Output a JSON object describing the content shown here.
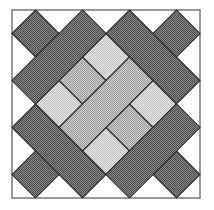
{
  "colors": {
    "background": "#ffffff",
    "border": "#777777",
    "outline": "#333333",
    "dark": "#6e6e6e",
    "medium": "#b4b4b4",
    "light": "#d6d6d6"
  },
  "frame": {
    "x": 12,
    "y": 10,
    "size": 188,
    "units": 8
  },
  "pieces": [
    {
      "name": "corner-square-top-left",
      "tone": "dark",
      "points": [
        [
          1,
          0
        ],
        [
          2,
          1
        ],
        [
          1,
          2
        ],
        [
          0,
          1
        ]
      ]
    },
    {
      "name": "corner-square-top-right",
      "tone": "dark",
      "points": [
        [
          7,
          0
        ],
        [
          8,
          1
        ],
        [
          7,
          2
        ],
        [
          6,
          1
        ]
      ]
    },
    {
      "name": "corner-square-bottom-left",
      "tone": "dark",
      "points": [
        [
          1,
          6
        ],
        [
          2,
          7
        ],
        [
          1,
          8
        ],
        [
          0,
          7
        ]
      ]
    },
    {
      "name": "corner-square-bottom-right",
      "tone": "dark",
      "points": [
        [
          7,
          6
        ],
        [
          8,
          7
        ],
        [
          7,
          8
        ],
        [
          6,
          7
        ]
      ]
    },
    {
      "name": "center-square-top",
      "tone": "light",
      "points": [
        [
          4,
          1
        ],
        [
          5,
          2
        ],
        [
          4,
          3
        ],
        [
          3,
          2
        ]
      ]
    },
    {
      "name": "center-square-left",
      "tone": "light",
      "points": [
        [
          2,
          3
        ],
        [
          3,
          4
        ],
        [
          2,
          5
        ],
        [
          1,
          4
        ]
      ]
    },
    {
      "name": "center-square-right",
      "tone": "light",
      "points": [
        [
          6,
          3
        ],
        [
          7,
          4
        ],
        [
          6,
          5
        ],
        [
          5,
          4
        ]
      ]
    },
    {
      "name": "center-square-bottom",
      "tone": "light",
      "points": [
        [
          4,
          5
        ],
        [
          5,
          6
        ],
        [
          4,
          7
        ],
        [
          3,
          6
        ]
      ]
    },
    {
      "name": "center-rect-upper-left",
      "tone": "medium",
      "points": [
        [
          3,
          2
        ],
        [
          4,
          3
        ],
        [
          3,
          4
        ],
        [
          2,
          3
        ]
      ]
    },
    {
      "name": "center-rect-lower-right",
      "tone": "medium",
      "points": [
        [
          5,
          4
        ],
        [
          6,
          5
        ],
        [
          5,
          6
        ],
        [
          4,
          5
        ]
      ]
    },
    {
      "name": "center-bar",
      "tone": "medium",
      "points": [
        [
          5,
          2
        ],
        [
          6,
          3
        ],
        [
          3,
          6
        ],
        [
          2,
          5
        ]
      ]
    },
    {
      "name": "bar-top-left",
      "tone": "dark",
      "points": [
        [
          3,
          0
        ],
        [
          4,
          1
        ],
        [
          1,
          4
        ],
        [
          0,
          3
        ]
      ]
    },
    {
      "name": "bar-top-right",
      "tone": "dark",
      "points": [
        [
          5,
          0
        ],
        [
          8,
          3
        ],
        [
          7,
          4
        ],
        [
          4,
          1
        ]
      ]
    },
    {
      "name": "bar-bottom-left",
      "tone": "dark",
      "points": [
        [
          1,
          4
        ],
        [
          4,
          7
        ],
        [
          3,
          8
        ],
        [
          0,
          5
        ]
      ]
    },
    {
      "name": "bar-bottom-right",
      "tone": "dark",
      "points": [
        [
          7,
          4
        ],
        [
          8,
          5
        ],
        [
          5,
          8
        ],
        [
          4,
          7
        ]
      ]
    }
  ]
}
